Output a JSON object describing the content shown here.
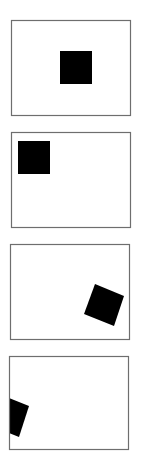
{
  "figure": {
    "background": "#ffffff",
    "frame_color": "#6e6e6e",
    "shape_color": "#000000",
    "panels": [
      {
        "id": "panel-1",
        "description": "Square centered-right, upright",
        "frame": {
          "x": 11,
          "y": 20,
          "w": 119,
          "h": 95
        },
        "shape_points": "60,51 92,51 92,84 60,84"
      },
      {
        "id": "panel-2",
        "description": "Square at top-left, upright",
        "frame": {
          "x": 11,
          "y": 132,
          "w": 119,
          "h": 95
        },
        "shape_points": "18,141 50,141 50,174 18,174"
      },
      {
        "id": "panel-3",
        "description": "Square at lower-right, rotated",
        "frame": {
          "x": 10,
          "y": 244,
          "w": 119,
          "h": 95
        },
        "shape_points": "95,284 124,296 114,326 84,314"
      },
      {
        "id": "panel-4",
        "description": "Square at left edge, rotated and clipped by frame",
        "frame": {
          "x": 9,
          "y": 356,
          "w": 119,
          "h": 93
        },
        "shape_points": "9,398 29,406 19,437 9,433"
      }
    ]
  }
}
